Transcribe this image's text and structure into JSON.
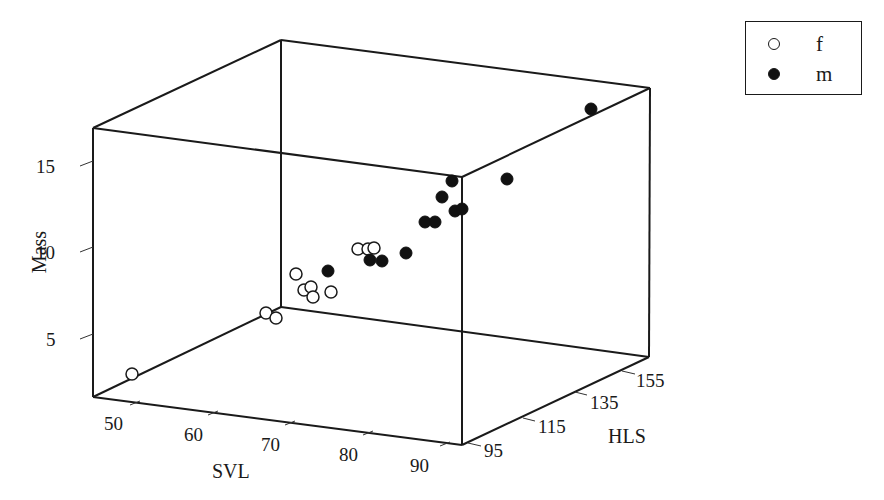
{
  "chart_data": {
    "type": "scatter3d",
    "title": "",
    "axes": {
      "x": {
        "label": "SVL",
        "ticks": [
          50,
          60,
          70,
          80,
          90
        ],
        "range": [
          45,
          95
        ]
      },
      "y": {
        "label": "HLS",
        "ticks": [
          95,
          115,
          135,
          155
        ],
        "range": [
          90,
          165
        ]
      },
      "z": {
        "label": "Mass",
        "ticks": [
          5,
          10,
          15
        ],
        "range": [
          2,
          17
        ]
      }
    },
    "legend": {
      "position": "top-right",
      "entries": [
        {
          "label": "f",
          "marker": "open-circle"
        },
        {
          "label": "m",
          "marker": "filled-circle"
        }
      ]
    },
    "series": [
      {
        "name": "f",
        "marker": "open-circle",
        "points": [
          {
            "SVL": 48,
            "HLS": 110,
            "Mass": 2.7,
            "px": [
              132,
              374
            ]
          },
          {
            "SVL": 63,
            "HLS": 158,
            "Mass": 4.5,
            "px": [
              266,
              313
            ]
          },
          {
            "SVL": 64,
            "HLS": 158,
            "Mass": 4.4,
            "px": [
              276,
              318
            ]
          },
          {
            "SVL": 66,
            "HLS": 150,
            "Mass": 6.8,
            "px": [
              296,
              274
            ]
          },
          {
            "SVL": 67,
            "HLS": 148,
            "Mass": 6.0,
            "px": [
              304,
              290
            ]
          },
          {
            "SVL": 67.5,
            "HLS": 150,
            "Mass": 6.2,
            "px": [
              311,
              287
            ]
          },
          {
            "SVL": 68,
            "HLS": 148,
            "Mass": 5.5,
            "px": [
              313,
              297
            ]
          },
          {
            "SVL": 70,
            "HLS": 145,
            "Mass": 5.8,
            "px": [
              331,
              292
            ]
          },
          {
            "SVL": 73,
            "HLS": 152,
            "Mass": 8.5,
            "px": [
              358,
              249
            ]
          },
          {
            "SVL": 74,
            "HLS": 152,
            "Mass": 8.5,
            "px": [
              368,
              249
            ]
          },
          {
            "SVL": 74.5,
            "HLS": 153,
            "Mass": 8.6,
            "px": [
              374,
              248
            ]
          }
        ]
      },
      {
        "name": "m",
        "marker": "filled-circle",
        "points": [
          {
            "SVL": 70,
            "HLS": 148,
            "Mass": 7.0,
            "px": [
              328,
              271
            ]
          },
          {
            "SVL": 75,
            "HLS": 148,
            "Mass": 7.8,
            "px": [
              370,
              260
            ]
          },
          {
            "SVL": 76,
            "HLS": 148,
            "Mass": 7.7,
            "px": [
              382,
              261
            ]
          },
          {
            "SVL": 79,
            "HLS": 150,
            "Mass": 8.2,
            "px": [
              406,
              253
            ]
          },
          {
            "SVL": 82,
            "HLS": 152,
            "Mass": 10.0,
            "px": [
              425,
              222
            ]
          },
          {
            "SVL": 83,
            "HLS": 152,
            "Mass": 10.0,
            "px": [
              435,
              222
            ]
          },
          {
            "SVL": 84,
            "HLS": 155,
            "Mass": 11.5,
            "px": [
              442,
              197
            ]
          },
          {
            "SVL": 85,
            "HLS": 155,
            "Mass": 12.3,
            "px": [
              452,
              181
            ]
          },
          {
            "SVL": 85.5,
            "HLS": 152,
            "Mass": 10.5,
            "px": [
              455,
              211
            ]
          },
          {
            "SVL": 86.5,
            "HLS": 152,
            "Mass": 10.5,
            "px": [
              462,
              209
            ]
          },
          {
            "SVL": 90,
            "HLS": 156,
            "Mass": 12.0,
            "px": [
              507,
              179
            ]
          },
          {
            "SVL": 94,
            "HLS": 165,
            "Mass": 16.0,
            "px": [
              591,
              109
            ]
          }
        ]
      }
    ],
    "grid": false
  },
  "box": {
    "front_top_left": [
      93,
      128
    ],
    "front_top_right": [
      462,
      177
    ],
    "front_bottom_left": [
      93,
      397
    ],
    "front_bottom_right": [
      462,
      445
    ],
    "back_top_left": [
      281,
      40
    ],
    "back_top_right": [
      650,
      88
    ],
    "back_bottom_left": [
      281,
      307
    ],
    "back_bottom_right": [
      649,
      357
    ]
  },
  "tick_positions": {
    "z": [
      {
        "label": "5",
        "tick": [
          [
            80,
            339
          ],
          [
            93,
            334
          ]
        ],
        "text": [
          46,
          346
        ]
      },
      {
        "label": "10",
        "tick": [
          [
            80,
            252
          ],
          [
            93,
            247
          ]
        ],
        "text": [
          36,
          259
        ]
      },
      {
        "label": "15",
        "tick": [
          [
            80,
            166
          ],
          [
            93,
            161
          ]
        ],
        "text": [
          36,
          173
        ]
      }
    ],
    "x": [
      {
        "label": "50",
        "tick": [
          [
            130,
            405
          ],
          [
            140,
            401
          ]
        ],
        "text": [
          104,
          430
        ]
      },
      {
        "label": "60",
        "tick": [
          [
            208,
            415
          ],
          [
            218,
            411
          ]
        ],
        "text": [
          184,
          441
        ]
      },
      {
        "label": "70",
        "tick": [
          [
            285,
            425
          ],
          [
            295,
            421
          ]
        ],
        "text": [
          261,
          451
        ]
      },
      {
        "label": "80",
        "tick": [
          [
            363,
            435
          ],
          [
            373,
            431
          ]
        ],
        "text": [
          339,
          461
        ]
      },
      {
        "label": "90",
        "tick": [
          [
            440,
            446
          ],
          [
            450,
            442
          ]
        ],
        "text": [
          410,
          472
        ]
      }
    ],
    "y": [
      {
        "label": "95",
        "tick": [
          [
            468,
            443
          ],
          [
            481,
            446
          ]
        ],
        "text": [
          484,
          457
        ]
      },
      {
        "label": "115",
        "tick": [
          [
            523,
            418
          ],
          [
            535,
            421
          ]
        ],
        "text": [
          538,
          433
        ]
      },
      {
        "label": "135",
        "tick": [
          [
            575,
            392
          ],
          [
            587,
            395
          ]
        ],
        "text": [
          590,
          409
        ]
      },
      {
        "label": "155",
        "tick": [
          [
            622,
            371
          ],
          [
            635,
            374
          ]
        ],
        "text": [
          636,
          387
        ]
      }
    ]
  },
  "axis_label_positions": {
    "x": [
      212,
      478
    ],
    "y": [
      608,
      443
    ],
    "z": [
      46,
      252
    ]
  }
}
